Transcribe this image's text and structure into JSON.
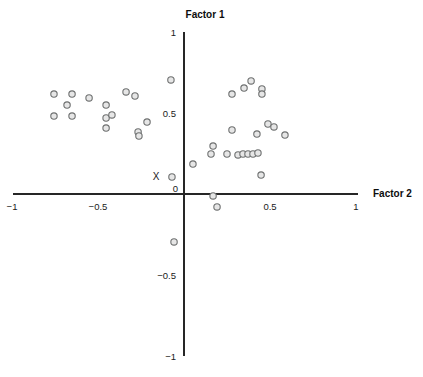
{
  "chart_data": {
    "type": "scatter",
    "title": "",
    "xlabel": "Factor 2",
    "ylabel": "Factor 1",
    "xlim": [
      -1,
      1
    ],
    "ylim": [
      -1,
      1
    ],
    "grid": false,
    "legend": null,
    "axes_style": "centered-cross",
    "xticks": [
      -1,
      -0.5,
      0,
      0.5,
      1
    ],
    "xtick_labels": [
      "-1",
      "-0.5",
      "0.5",
      "1"
    ],
    "yticks": [
      -1,
      -0.5,
      0.5,
      1
    ],
    "ytick_labels": [
      "1",
      "0.5",
      "-0.5",
      "-1"
    ],
    "origin_label": "0",
    "annotations": [
      {
        "text": "X",
        "x": -0.12,
        "y": 0.105
      }
    ],
    "series": [
      {
        "name": "loadings",
        "marker": "open-circle",
        "marker_color": "#6e7070",
        "marker_fill": "#e6e6e6",
        "points": [
          {
            "x": -0.756,
            "y": 0.617
          },
          {
            "x": -0.68,
            "y": 0.549
          },
          {
            "x": -0.651,
            "y": 0.617
          },
          {
            "x": -0.756,
            "y": 0.481
          },
          {
            "x": -0.651,
            "y": 0.481
          },
          {
            "x": -0.552,
            "y": 0.593
          },
          {
            "x": -0.453,
            "y": 0.549
          },
          {
            "x": -0.453,
            "y": 0.469
          },
          {
            "x": -0.453,
            "y": 0.407
          },
          {
            "x": -0.337,
            "y": 0.63
          },
          {
            "x": -0.285,
            "y": 0.605
          },
          {
            "x": -0.419,
            "y": 0.488
          },
          {
            "x": -0.215,
            "y": 0.444
          },
          {
            "x": -0.267,
            "y": 0.383
          },
          {
            "x": -0.262,
            "y": 0.358
          },
          {
            "x": -0.076,
            "y": 0.704
          },
          {
            "x": -0.07,
            "y": 0.105
          },
          {
            "x": -0.058,
            "y": -0.296
          },
          {
            "x": 0.052,
            "y": 0.185
          },
          {
            "x": 0.169,
            "y": 0.296
          },
          {
            "x": 0.157,
            "y": 0.247
          },
          {
            "x": 0.25,
            "y": 0.247
          },
          {
            "x": 0.314,
            "y": 0.241
          },
          {
            "x": 0.343,
            "y": 0.247
          },
          {
            "x": 0.372,
            "y": 0.247
          },
          {
            "x": 0.401,
            "y": 0.247
          },
          {
            "x": 0.43,
            "y": 0.253
          },
          {
            "x": 0.279,
            "y": 0.395
          },
          {
            "x": 0.424,
            "y": 0.37
          },
          {
            "x": 0.488,
            "y": 0.432
          },
          {
            "x": 0.523,
            "y": 0.414
          },
          {
            "x": 0.587,
            "y": 0.364
          },
          {
            "x": 0.279,
            "y": 0.617
          },
          {
            "x": 0.349,
            "y": 0.654
          },
          {
            "x": 0.39,
            "y": 0.698
          },
          {
            "x": 0.453,
            "y": 0.648
          },
          {
            "x": 0.453,
            "y": 0.617
          },
          {
            "x": 0.448,
            "y": 0.117
          },
          {
            "x": 0.169,
            "y": -0.012
          },
          {
            "x": 0.192,
            "y": -0.08
          }
        ]
      }
    ]
  },
  "labels": {
    "x_axis_title": "Factor 2",
    "y_axis_title": "Factor 1"
  }
}
